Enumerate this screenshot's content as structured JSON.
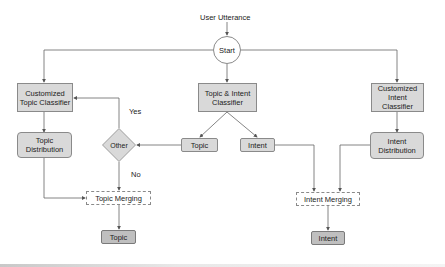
{
  "diagram": {
    "type": "flowchart",
    "input_label": "User Utterance",
    "start": "Start",
    "nodes": {
      "customized_topic_classifier": "Customized Topic Classifier",
      "topic_distribution": "Topic Distribution",
      "topic_intent_classifier": "Topic & Intent Classifier",
      "topic_branch": "Topic",
      "intent_branch": "Intent",
      "other_decision": "Other",
      "topic_merging": "Topic Merging",
      "topic_output": "Topic",
      "customized_intent_classifier": "Customized Intent Classifier",
      "intent_distribution": "Intent Distribution",
      "intent_merging": "Intent Merging",
      "intent_output": "Intent"
    },
    "edge_labels": {
      "yes": "Yes",
      "no": "No"
    },
    "colors": {
      "box_fill": "#d9d9d9",
      "output_fill": "#bfbfbf",
      "stroke": "#8a8a8a",
      "line": "#666666"
    }
  }
}
